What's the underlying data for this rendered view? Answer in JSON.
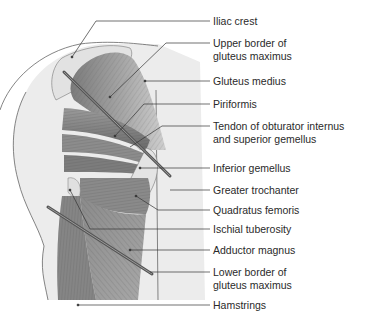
{
  "figure": {
    "labels": [
      {
        "id": "iliac-crest",
        "text": "Iliac crest",
        "y": 15
      },
      {
        "id": "upper-border",
        "text": "Upper border of\ngluteus maximus",
        "y": 39
      },
      {
        "id": "gluteus-medius",
        "text": "Gluteus medius",
        "y": 75
      },
      {
        "id": "piriformis",
        "text": "Piriformis",
        "y": 98
      },
      {
        "id": "tendon-obturator",
        "text": "Tendon of obturator internus\nand superior gemellus",
        "y": 120
      },
      {
        "id": "inferior-gemellus",
        "text": "Inferior gemellus",
        "y": 162
      },
      {
        "id": "greater-trochanter",
        "text": "Greater trochanter",
        "y": 185
      },
      {
        "id": "quadratus-femoris",
        "text": "Quadratus femoris",
        "y": 204
      },
      {
        "id": "ischial-tuberosity",
        "text": "Ischial tuberosity",
        "y": 225
      },
      {
        "id": "adductor-magnus",
        "text": "Adductor magnus",
        "y": 245
      },
      {
        "id": "lower-border",
        "text": "Lower border of\ngluteus maximus",
        "y": 267
      },
      {
        "id": "hamstrings",
        "text": "Hamstrings",
        "y": 300
      }
    ],
    "colors": {
      "muscle_dark": "#6e6e6e",
      "muscle_mid": "#8f8f8f",
      "muscle_light": "#b8b8b8",
      "skin": "#ececec",
      "outline": "#555555",
      "leader": "#333333",
      "label_text": "#2a2a2a"
    }
  }
}
